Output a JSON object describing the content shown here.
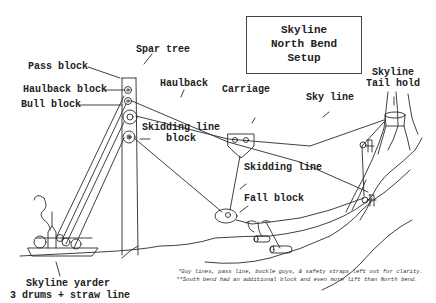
{
  "title": {
    "lines": [
      "Skyline",
      "North Bend",
      "Setup"
    ]
  },
  "labels": {
    "spar_tree": "Spar tree",
    "pass_block": "Pass block",
    "haulback_block": "Haulback block",
    "bull_block": "Bull block",
    "haulback": "Haulback",
    "carriage": "Carriage",
    "sky_line": "Sky line",
    "skyline_tail_hold_1": "Skyline",
    "skyline_tail_hold_2": "Tail hold",
    "skidding_line_block_1": "Skidding line",
    "skidding_line_block_2": "block",
    "skidding_line": "Skidding line",
    "fall_block": "Fall block",
    "yarder_1": "Skyline yarder",
    "yarder_2": "3 drums + straw line"
  },
  "notes": [
    "*Guy lines, pass line, buckle guys, & safety straps left out for clarity.",
    "**South bend had an additional block and even more lift than North bend."
  ],
  "colors": {
    "ink": "#222222",
    "background": "#ffffff"
  }
}
